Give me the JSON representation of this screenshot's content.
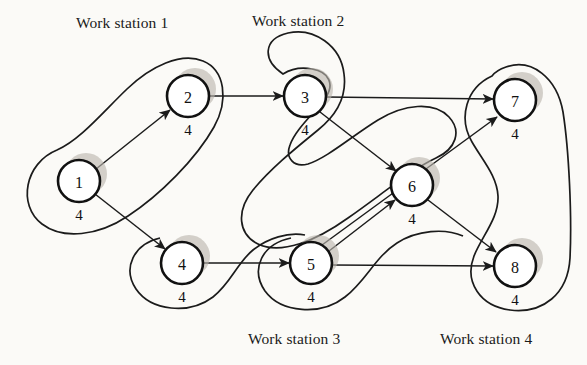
{
  "figure": {
    "type": "precedence-diagram",
    "node_time_unit_label": "4"
  },
  "workstations": [
    {
      "id": "ws1",
      "label": "Work station 1",
      "label_x": 76,
      "label_y": 14,
      "nodes": [
        "1",
        "2"
      ]
    },
    {
      "id": "ws2",
      "label": "Work station 2",
      "label_x": 252,
      "label_y": 12,
      "nodes": [
        "3",
        "6"
      ]
    },
    {
      "id": "ws3",
      "label": "Work station 3",
      "label_x": 248,
      "label_y": 330,
      "nodes": [
        "4",
        "5"
      ]
    },
    {
      "id": "ws4",
      "label": "Work station 4",
      "label_x": 440,
      "label_y": 330,
      "nodes": [
        "7",
        "8"
      ]
    }
  ],
  "nodes": [
    {
      "id": "1",
      "label": "1",
      "time": "4",
      "cx": 79,
      "cy": 181,
      "r": 21
    },
    {
      "id": "2",
      "label": "2",
      "time": "4",
      "cx": 188,
      "cy": 96,
      "r": 21
    },
    {
      "id": "3",
      "label": "3",
      "time": "4",
      "cx": 305,
      "cy": 96,
      "r": 21
    },
    {
      "id": "4",
      "label": "4",
      "time": "4",
      "cx": 182,
      "cy": 263,
      "r": 21
    },
    {
      "id": "5",
      "label": "5",
      "time": "4",
      "cx": 311,
      "cy": 263,
      "r": 21
    },
    {
      "id": "6",
      "label": "6",
      "time": "4",
      "cx": 412,
      "cy": 185,
      "r": 21
    },
    {
      "id": "7",
      "label": "7",
      "time": "4",
      "cx": 515,
      "cy": 100,
      "r": 21
    },
    {
      "id": "8",
      "label": "8",
      "time": "4",
      "cx": 515,
      "cy": 266,
      "r": 21
    }
  ],
  "edges": [
    {
      "from": "1",
      "to": "2"
    },
    {
      "from": "1",
      "to": "4"
    },
    {
      "from": "2",
      "to": "3"
    },
    {
      "from": "3",
      "to": "6"
    },
    {
      "from": "3",
      "to": "7"
    },
    {
      "from": "4",
      "to": "5"
    },
    {
      "from": "5",
      "to": "6"
    },
    {
      "from": "5",
      "to": "7"
    },
    {
      "from": "5",
      "to": "8"
    },
    {
      "from": "6",
      "to": "8"
    }
  ],
  "colors": {
    "ink": "#1b1b1b",
    "node_fill": "#ffffff",
    "node_shadow": "#b9b4ad",
    "page": "#fbfaf7"
  }
}
